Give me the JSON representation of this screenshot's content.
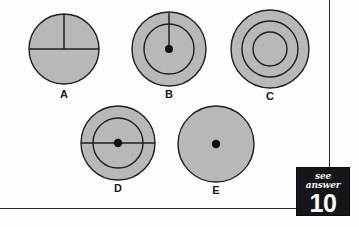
{
  "page": {
    "background_color": "#fdfdfd",
    "frame_color": "#2b2b2b"
  },
  "style": {
    "circle_fill": "#b8b8b8",
    "circle_stroke": "#1f1f1f",
    "dot_color": "#111111",
    "label_color": "#1a1a1a"
  },
  "figures": [
    {
      "id": "A",
      "label": "A",
      "description": "circle with horizontal diameter and upward vertical radius",
      "rings": 1,
      "center_dot": false,
      "lines": [
        "horizontal-diameter",
        "vertical-radius-up"
      ]
    },
    {
      "id": "B",
      "label": "B",
      "description": "two concentric circles with center dot and upward vertical radius",
      "rings": 2,
      "center_dot": true,
      "lines": [
        "vertical-radius-up"
      ]
    },
    {
      "id": "C",
      "label": "C",
      "description": "three concentric circles, no dot, no lines",
      "rings": 3,
      "center_dot": false,
      "lines": []
    },
    {
      "id": "D",
      "label": "D",
      "description": "two concentric circles with center dot and horizontal diameter",
      "rings": 2,
      "center_dot": true,
      "lines": [
        "horizontal-diameter"
      ]
    },
    {
      "id": "E",
      "label": "E",
      "description": "single circle with center dot",
      "rings": 1,
      "center_dot": true,
      "lines": []
    }
  ],
  "answer_badge": {
    "see_answer_text": "see answer",
    "answer_number": "10"
  }
}
